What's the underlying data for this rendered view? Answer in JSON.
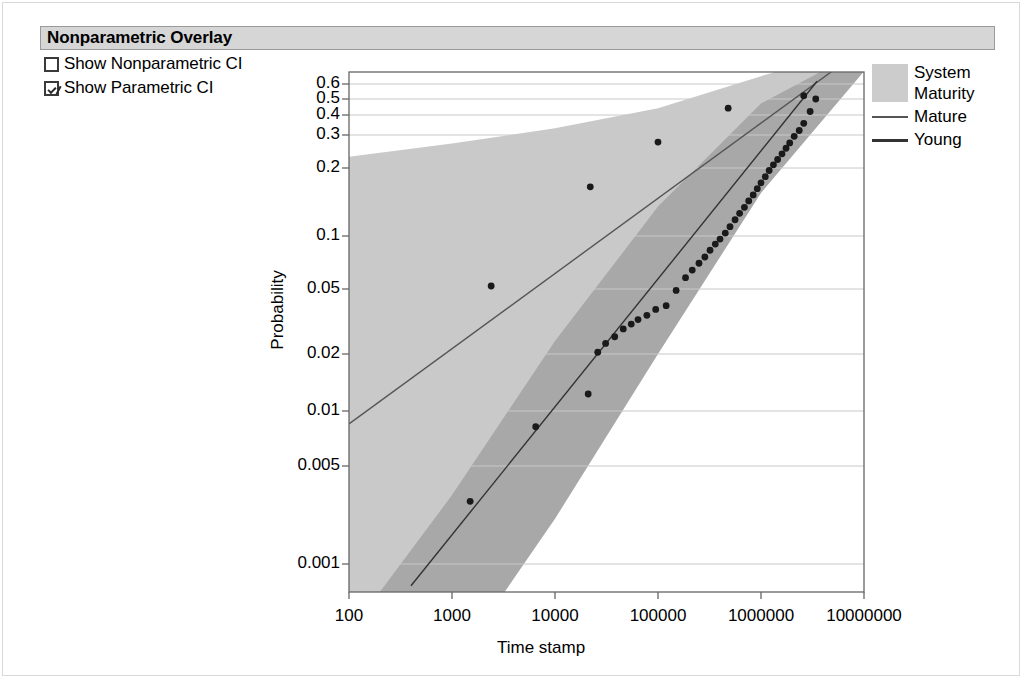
{
  "panel": {
    "header_title": "Nonparametric Overlay",
    "options": [
      {
        "label": "Show Nonparametric CI",
        "checked": false,
        "icon": "checkbox-empty-icon"
      },
      {
        "label": "Show Parametric CI",
        "checked": true,
        "icon": "checkbox-checked-icon"
      }
    ]
  },
  "legend": {
    "title": "System Maturity",
    "title_line1": "System",
    "title_line2": "Maturity",
    "swatch_color": "#cccccc",
    "entries": [
      {
        "label": "Mature",
        "color": "#555555"
      },
      {
        "label": "Young",
        "color": "#333333"
      }
    ]
  },
  "colors": {
    "band_mature": "#c9c9c9",
    "band_young": "#c2c2c2",
    "band_overlap": "#a8a8a8",
    "gridline": "#c8c8c8",
    "axis": "#666666",
    "point": "#1a1a1a",
    "header_bg": "#d6d6d6",
    "header_border": "#9a9a9a"
  },
  "chart_data": {
    "type": "scatter",
    "title": "",
    "xlabel": "Time stamp",
    "ylabel": "Probability",
    "xscale": "log",
    "yscale": "probability",
    "grid": true,
    "legend_position": "right",
    "xlim": [
      100,
      10000000
    ],
    "ylim": [
      0.0007,
      0.68
    ],
    "xticks": [
      100,
      1000,
      10000,
      100000,
      1000000,
      10000000
    ],
    "xticklabels": [
      "100",
      "1000",
      "10000",
      "100000",
      "1000000",
      "10000000"
    ],
    "yticks": [
      0.6,
      0.5,
      0.4,
      0.3,
      0.2,
      0.1,
      0.05,
      0.02,
      0.01,
      0.005,
      0.001
    ],
    "yticklabels": [
      "0.6",
      "0.5",
      "0.4",
      "0.3",
      "0.2",
      "0.1",
      "0.05",
      "0.02",
      "0.01",
      "0.005",
      "0.001"
    ],
    "series": [
      {
        "name": "Mature",
        "type": "line",
        "color": "#555555",
        "line_points": [
          [
            100,
            0.0085
          ],
          [
            10000000,
            0.93
          ]
        ],
        "ci_band": {
          "name": "Mature CI",
          "color": "#c9c9c9",
          "upper": [
            [
              100,
              0.23
            ],
            [
              1000,
              0.27
            ],
            [
              10000,
              0.33
            ],
            [
              100000,
              0.44
            ],
            [
              1000000,
              0.66
            ],
            [
              10000000,
              0.95
            ]
          ],
          "lower": [
            [
              100,
              0.00022
            ],
            [
              1000,
              0.0011
            ],
            [
              10000,
              0.0065
            ],
            [
              100000,
              0.038
            ],
            [
              1000000,
              0.21
            ],
            [
              10000000,
              0.72
            ]
          ]
        },
        "points": [
          [
            2400,
            0.052
          ],
          [
            22000,
            0.165
          ],
          [
            100000,
            0.275
          ],
          [
            480000,
            0.44
          ],
          [
            2600000,
            0.52
          ]
        ]
      },
      {
        "name": "Young",
        "type": "line",
        "color": "#333333",
        "line_points": [
          [
            400,
            0.0007
          ],
          [
            3500000,
            0.62
          ]
        ],
        "ci_band": {
          "name": "Young CI",
          "color": "#c2c2c2",
          "upper": [
            [
              100,
              0.00032
            ],
            [
              1000,
              0.0031
            ],
            [
              10000,
              0.024
            ],
            [
              100000,
              0.135
            ],
            [
              1000000,
              0.47
            ],
            [
              10000000,
              0.92
            ]
          ],
          "lower": [
            [
              1000,
              0.00018
            ],
            [
              10000,
              0.0021
            ],
            [
              100000,
              0.02
            ],
            [
              1000000,
              0.155
            ],
            [
              10000000,
              0.7
            ]
          ]
        },
        "points": [
          [
            1500,
            0.0028
          ],
          [
            6500,
            0.0082
          ],
          [
            21000,
            0.0123
          ],
          [
            26000,
            0.0205
          ],
          [
            31000,
            0.0232
          ],
          [
            38000,
            0.0255
          ],
          [
            46000,
            0.0285
          ],
          [
            55000,
            0.0305
          ],
          [
            64000,
            0.0325
          ],
          [
            78000,
            0.0345
          ],
          [
            95000,
            0.0375
          ],
          [
            120000,
            0.0395
          ],
          [
            150000,
            0.049
          ],
          [
            185000,
            0.058
          ],
          [
            215000,
            0.064
          ],
          [
            250000,
            0.07
          ],
          [
            285000,
            0.076
          ],
          [
            320000,
            0.083
          ],
          [
            360000,
            0.09
          ],
          [
            400000,
            0.096
          ],
          [
            450000,
            0.103
          ],
          [
            500000,
            0.11
          ],
          [
            560000,
            0.118
          ],
          [
            620000,
            0.126
          ],
          [
            690000,
            0.134
          ],
          [
            760000,
            0.143
          ],
          [
            840000,
            0.152
          ],
          [
            920000,
            0.162
          ],
          [
            1000000,
            0.172
          ],
          [
            1100000,
            0.183
          ],
          [
            1200000,
            0.195
          ],
          [
            1320000,
            0.208
          ],
          [
            1450000,
            0.222
          ],
          [
            1600000,
            0.238
          ],
          [
            1750000,
            0.255
          ],
          [
            1900000,
            0.272
          ],
          [
            2100000,
            0.295
          ],
          [
            2350000,
            0.32
          ],
          [
            2600000,
            0.355
          ],
          [
            3000000,
            0.42
          ],
          [
            3400000,
            0.5
          ]
        ]
      }
    ]
  }
}
